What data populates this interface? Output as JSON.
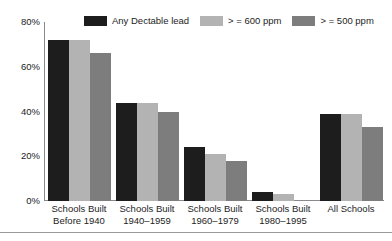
{
  "chart_data": {
    "type": "bar",
    "title": "",
    "xlabel": "",
    "ylabel": "",
    "ylim": [
      0,
      80
    ],
    "grid": false,
    "legend_position": "top",
    "ytick_labels": [
      "80%",
      "60%",
      "40%",
      "20%",
      "0%"
    ],
    "ytick_values": [
      80,
      60,
      40,
      20,
      0
    ],
    "categories": [
      "Schools Built\nBefore 1940",
      "Schools Built\n1940-1959",
      "Schools Built\n1960-1979",
      "Schools Built\n1980-1995",
      "All Schools"
    ],
    "category_lines": [
      [
        "Schools Built",
        "Before 1940"
      ],
      [
        "Schools Built",
        "1940–1959"
      ],
      [
        "Schools Built",
        "1960–1979"
      ],
      [
        "Schools Built",
        "1980–1995"
      ],
      [
        "All Schools",
        ""
      ]
    ],
    "series": [
      {
        "name": "Any Dectable lead",
        "color": "#1d1d1d",
        "values": [
          72,
          44,
          24,
          4,
          39
        ]
      },
      {
        "name": "> = 600 ppm",
        "color": "#b3b3b3",
        "values": [
          72,
          44,
          21,
          3,
          39
        ]
      },
      {
        "name": "> = 500 ppm",
        "color": "#7d7d7d",
        "values": [
          66,
          40,
          18,
          0,
          33
        ]
      }
    ]
  },
  "axis": {
    "line_color": "#8a8a8a"
  }
}
